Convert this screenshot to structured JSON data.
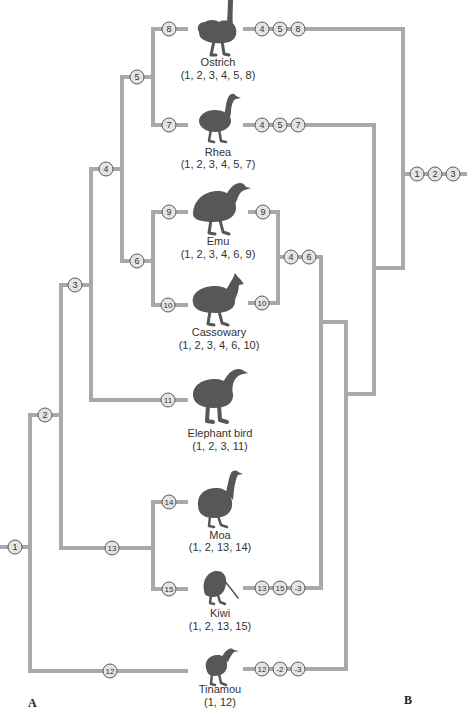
{
  "colors": {
    "branch": "#a9a9a9",
    "marker_fill": "#e4e4e4",
    "marker_stroke": "#5a5a5a",
    "silhouette": "#575757",
    "text": "#333333"
  },
  "taxa": [
    {
      "name": "Ostrich",
      "characters": "(1, 2, 3, 4, 5, 8)",
      "icon": "ostrich-silhouette"
    },
    {
      "name": "Rhea",
      "characters": "(1, 2, 3, 4, 5, 7)",
      "icon": "rhea-silhouette"
    },
    {
      "name": "Emu",
      "characters": "(1, 2, 3, 4, 6, 9)",
      "icon": "emu-silhouette"
    },
    {
      "name": "Cassowary",
      "characters": "(1, 2, 3, 4, 6, 10)",
      "icon": "cassowary-silhouette"
    },
    {
      "name": "Elephant bird",
      "characters": "(1, 2, 3, 11)",
      "icon": "elephant-bird-silhouette"
    },
    {
      "name": "Moa",
      "characters": "(1, 2, 13, 14)",
      "icon": "moa-silhouette"
    },
    {
      "name": "Kiwi",
      "characters": "(1, 2, 13, 15)",
      "icon": "kiwi-silhouette"
    },
    {
      "name": "Tinamou",
      "characters": "(1, 12)",
      "icon": "tinamou-silhouette"
    }
  ],
  "tree_a": {
    "label": "A",
    "node_markers": [
      "1",
      "2",
      "3",
      "4",
      "5",
      "6",
      "7",
      "8",
      "9",
      "10",
      "11",
      "12",
      "13",
      "14",
      "15"
    ]
  },
  "tree_b": {
    "label": "B",
    "root": [
      "1",
      "2",
      "3"
    ],
    "ostrich": [
      "4",
      "5",
      "8"
    ],
    "rhea": [
      "4",
      "5",
      "7"
    ],
    "emu": [
      "9"
    ],
    "cassowary": [
      "10"
    ],
    "emu_cassowary_clade": [
      "4",
      "6"
    ],
    "kiwi": [
      "13",
      "15",
      "-3"
    ],
    "tinamou": [
      "12",
      "-2",
      "-3"
    ]
  }
}
